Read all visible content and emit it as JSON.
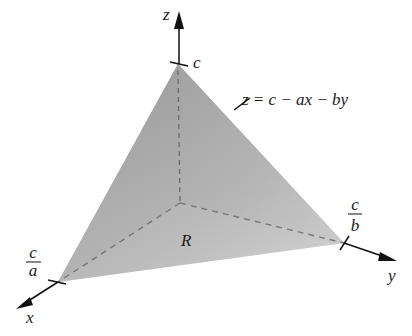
{
  "diagram": {
    "type": "3d-plane-tetrahedron",
    "axes": {
      "x_label": "x",
      "y_label": "y",
      "z_label": "z"
    },
    "intercepts": {
      "z": {
        "label": "c"
      },
      "x": {
        "numerator": "c",
        "denominator": "a"
      },
      "y": {
        "numerator": "c",
        "denominator": "b"
      }
    },
    "surface_label": "z = c − ax − by",
    "region_label": "R",
    "colors": {
      "left_face": "#a9a9a9",
      "right_face": "#b8b8b8",
      "region": "#dcdcdc",
      "axis": "#111111"
    }
  }
}
